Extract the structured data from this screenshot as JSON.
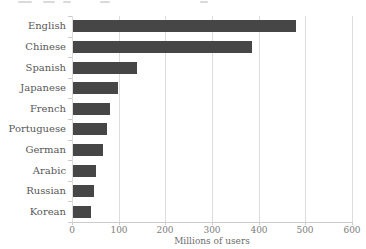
{
  "chart_data": {
    "type": "bar",
    "orientation": "horizontal",
    "categories": [
      "English",
      "Chinese",
      "Spanish",
      "Japanese",
      "French",
      "Portuguese",
      "German",
      "Arabic",
      "Russian",
      "Korean"
    ],
    "values": [
      478,
      384,
      136,
      96,
      79,
      73,
      65,
      50,
      45,
      38
    ],
    "xlabel": "Millions of users",
    "x_ticks": [
      0,
      100,
      200,
      300,
      400,
      500,
      600
    ],
    "xlim": [
      0,
      600
    ],
    "grid": true,
    "legend": false,
    "colors": {
      "bar": "#464646",
      "grid": "#dcdcdc",
      "axis": "#cccccc",
      "category_label": "#585858",
      "tick_label": "#7d7d7d",
      "axis_title": "#6e6e6e"
    }
  }
}
